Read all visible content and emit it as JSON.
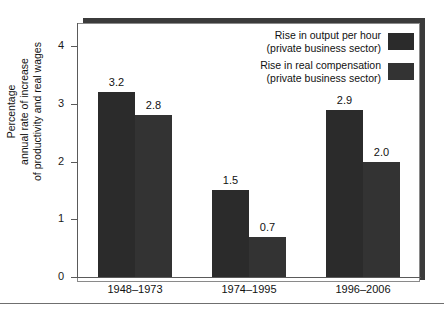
{
  "chart_data": {
    "type": "bar",
    "title": "",
    "subtitle": "",
    "xlabel": "",
    "ylabel": "Percentage annual rate of increase of productivity and real wages",
    "ylabel_lines": [
      "Percentage",
      "annual rate of increase",
      "of productivity and real wages"
    ],
    "categories": [
      "1948–1973",
      "1974–1995",
      "1996–2006"
    ],
    "series": [
      {
        "name": "Rise in output per hour (private business sector)",
        "name_lines": [
          "Rise in output per hour",
          "(private business sector)"
        ],
        "color": "#2b2b2b",
        "values": [
          3.2,
          2.8,
          2.9
        ]
      },
      {
        "name": "Rise in real compensation (private business sector)",
        "name_lines": [
          "Rise in real compensation",
          "(private business sector)"
        ],
        "color": "#333333",
        "values": [
          2.8,
          0.7,
          2.0
        ]
      }
    ],
    "bars": [
      {
        "category": "1948–1973",
        "series": 0,
        "value": 3.2,
        "label": "3.2"
      },
      {
        "category": "1948–1973",
        "series": 1,
        "value": 2.8,
        "label": "2.8"
      },
      {
        "category": "1974–1995",
        "series": 0,
        "value": 1.5,
        "label": "1.5"
      },
      {
        "category": "1974–1995",
        "series": 1,
        "value": 0.7,
        "label": "0.7"
      },
      {
        "category": "1996–2006",
        "series": 0,
        "value": 2.9,
        "label": "2.9"
      },
      {
        "category": "1996–2006",
        "series": 1,
        "value": 2.0,
        "label": "2.0"
      }
    ],
    "yticks": [
      0,
      1,
      2,
      3,
      4
    ],
    "ytick_labels": [
      "0",
      "1",
      "2",
      "3",
      "4"
    ],
    "ylim": [
      0,
      4.4
    ],
    "grid": false,
    "legend_position": "top-right"
  },
  "axis": {
    "y_title_line1": "Percentage",
    "y_title_line2": "annual rate of increase",
    "y_title_line3": "of productivity and real wages"
  },
  "legend": {
    "entries": [
      {
        "line1": "Rise in output per hour",
        "line2": "(private business sector)"
      },
      {
        "line1": "Rise in real compensation",
        "line2": "(private business sector)"
      }
    ]
  },
  "colors": {
    "series0": "#2b2b2b",
    "series1": "#333333",
    "axis": "#5a5a5a",
    "panel_shadow": "#3b3b3b",
    "panel_background": "#ffffff",
    "rule": "#6f6f6f"
  }
}
